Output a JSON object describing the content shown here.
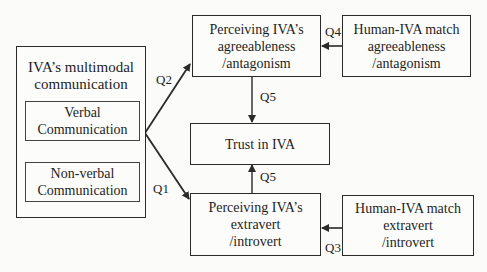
{
  "diagram": {
    "nodes": {
      "multimodal": {
        "title_line1": "IVA’s multimodal",
        "title_line2": "communication"
      },
      "verbal": {
        "line1": "Verbal",
        "line2": "Communication"
      },
      "nonverbal": {
        "line1": "Non-verbal",
        "line2": "Communication"
      },
      "agreeableness": {
        "line1": "Perceiving IVA’s",
        "line2": "agreeableness",
        "line3": "/antagonism"
      },
      "trust": {
        "line1": "Trust in IVA"
      },
      "extravert": {
        "line1": "Perceiving IVA’s",
        "line2": "extravert",
        "line3": "/introvert"
      },
      "match_agree": {
        "line1": "Human-IVA match",
        "line2": "agreeableness",
        "line3": "/antagonism"
      },
      "match_extra": {
        "line1": "Human-IVA match",
        "line2": "extravert",
        "line3": "/introvert"
      }
    },
    "edges": [
      {
        "from": "multimodal",
        "to": "agreeableness",
        "label": "Q2"
      },
      {
        "from": "multimodal",
        "to": "extravert",
        "label": "Q1"
      },
      {
        "from": "match_agree",
        "to": "agreeableness",
        "label": "Q4"
      },
      {
        "from": "match_extra",
        "to": "extravert",
        "label": "Q3"
      },
      {
        "from": "agreeableness",
        "to": "trust",
        "label": "Q5"
      },
      {
        "from": "extravert",
        "to": "trust",
        "label": "Q5"
      }
    ],
    "colors": {
      "line": "#2a2a2a",
      "background": "#fbfbfa"
    }
  }
}
